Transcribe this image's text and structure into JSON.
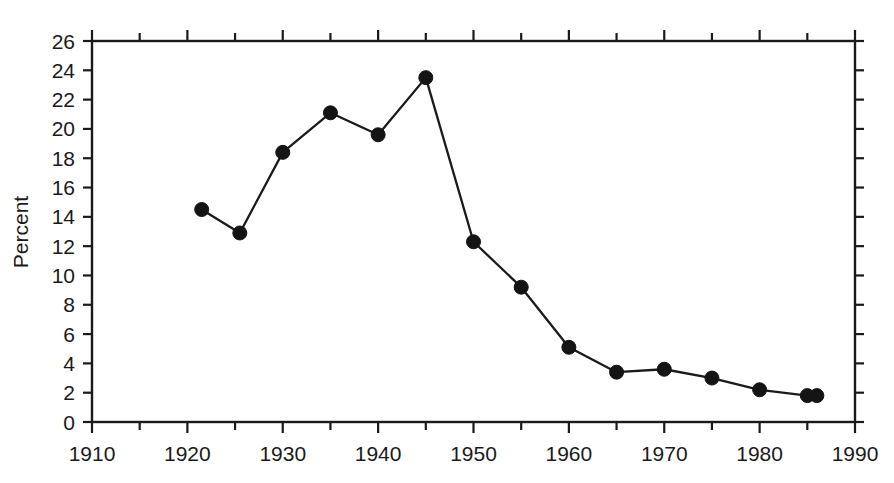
{
  "chart_data": {
    "type": "line",
    "title": "",
    "subtitle": "",
    "xlabel": "",
    "ylabel": "Percent",
    "xlim": [
      1910,
      1990
    ],
    "ylim": [
      0,
      26
    ],
    "x_major_step": 10,
    "x_minor_step": 5,
    "y_major_step": 2,
    "grid": false,
    "legend": null,
    "x_tick_labels": [
      "1910",
      "1920",
      "1930",
      "1940",
      "1950",
      "1960",
      "1970",
      "1980",
      "1990"
    ],
    "y_tick_labels": [
      "0",
      "2",
      "4",
      "6",
      "8",
      "10",
      "12",
      "14",
      "16",
      "18",
      "20",
      "22",
      "24",
      "26"
    ],
    "series": [
      {
        "name": "Percent",
        "marker": "filled-circle",
        "color": "#141414",
        "x": [
          1921.5,
          1925.5,
          1930,
          1935,
          1940,
          1945,
          1950,
          1955,
          1960,
          1965,
          1970,
          1975,
          1980,
          1985,
          1986
        ],
        "values": [
          14.5,
          12.9,
          18.4,
          21.1,
          19.6,
          23.5,
          12.3,
          9.2,
          5.1,
          3.4,
          3.6,
          3.0,
          2.2,
          1.8,
          1.8
        ]
      }
    ]
  },
  "axes": {
    "y_axis_title": "Percent"
  }
}
